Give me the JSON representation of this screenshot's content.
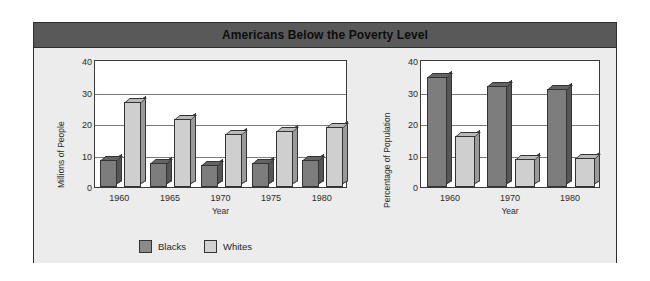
{
  "figure": {
    "title": "Americans Below the Poverty Level",
    "background_color": "#ececec",
    "title_bar_color": "#595959"
  },
  "legend": {
    "position": "bottom-left",
    "items": [
      {
        "label": "Blacks",
        "color": "#8a8a8a",
        "swatch": "blacks-swatch"
      },
      {
        "label": "Whites",
        "color": "#d2d2d2",
        "swatch": "whites-swatch"
      }
    ]
  },
  "chart_data": [
    {
      "type": "bar",
      "title": "",
      "id": "millions-of-people",
      "xlabel": "Year",
      "ylabel": "Millions of People",
      "categories": [
        "1960",
        "1965",
        "1970",
        "1975",
        "1980"
      ],
      "yticks": [
        "40",
        "30",
        "20",
        "10",
        "0"
      ],
      "ylim": [
        0,
        40
      ],
      "grid": true,
      "legend": [
        "Blacks",
        "Whites"
      ],
      "series": [
        {
          "name": "Blacks",
          "color": "#7d7d7d",
          "values": [
            8.5,
            7.5,
            7.0,
            7.5,
            8.5
          ]
        },
        {
          "name": "Whites",
          "color": "#cfcfcf",
          "values": [
            27.0,
            21.5,
            16.8,
            17.8,
            19.0
          ]
        }
      ]
    },
    {
      "type": "bar",
      "title": "",
      "id": "percentage-of-population",
      "xlabel": "Year",
      "ylabel": "Percentage of Population",
      "categories": [
        "1960",
        "1970",
        "1980"
      ],
      "yticks": [
        "40",
        "30",
        "20",
        "10",
        "0"
      ],
      "ylim": [
        0,
        40
      ],
      "grid": true,
      "legend": [
        "Blacks",
        "Whites"
      ],
      "series": [
        {
          "name": "Blacks",
          "color": "#7d7d7d",
          "values": [
            35.0,
            32.0,
            31.0
          ]
        },
        {
          "name": "Whites",
          "color": "#cfcfcf",
          "values": [
            16.3,
            9.0,
            9.3
          ]
        }
      ]
    }
  ]
}
